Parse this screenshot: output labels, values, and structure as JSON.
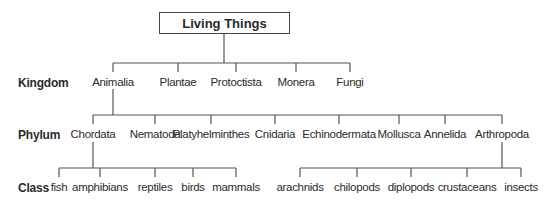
{
  "title": "Living Things",
  "row_labels": {
    "kingdom": "Kingdom",
    "phylum": "Phylum",
    "class": "Class"
  },
  "kingdom": [
    {
      "label": "Animalia",
      "x": 113
    },
    {
      "label": "Plantae",
      "x": 178
    },
    {
      "label": "Protoctista",
      "x": 236
    },
    {
      "label": "Monera",
      "x": 296
    },
    {
      "label": "Fungi",
      "x": 350
    }
  ],
  "phylum": [
    {
      "label": "Chordata",
      "x": 93
    },
    {
      "label": "Nematoda",
      "x": 155
    },
    {
      "label": "Platyhelminthes",
      "x": 211
    },
    {
      "label": "Cnidaria",
      "x": 275
    },
    {
      "label": "Echinodermata",
      "x": 339
    },
    {
      "label": "Mollusca",
      "x": 399
    },
    {
      "label": "Annelida",
      "x": 445
    },
    {
      "label": "Arthropoda",
      "x": 502
    }
  ],
  "class_chordata": [
    {
      "label": "fish",
      "x": 59
    },
    {
      "label": "amphibians",
      "x": 100
    },
    {
      "label": "reptiles",
      "x": 155
    },
    {
      "label": "birds",
      "x": 193
    },
    {
      "label": "mammals",
      "x": 236
    }
  ],
  "class_arthropoda": [
    {
      "label": "arachnids",
      "x": 300
    },
    {
      "label": "chilopods",
      "x": 357
    },
    {
      "label": "diplopods",
      "x": 411
    },
    {
      "label": "crustaceans",
      "x": 467
    },
    {
      "label": "insects",
      "x": 521
    }
  ]
}
